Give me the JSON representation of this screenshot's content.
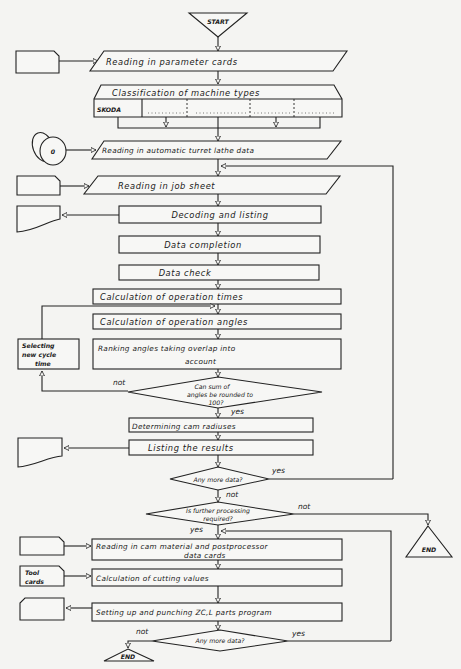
{
  "diagram": {
    "type": "flowchart",
    "terminals": {
      "start": "START",
      "end_1": "END",
      "end_2": "END"
    },
    "steps": {
      "s1": "Reading in parameter cards",
      "s2": "Classification of machine types",
      "s2_first_cell": "SKODA",
      "s3": "Reading in automatic turret lathe data",
      "s4": "Reading in job sheet",
      "s5": "Decoding and listing",
      "s6": "Data completion",
      "s7": "Data check",
      "s8": "Calculation of operation times",
      "s9": "Calculation of operation angles",
      "s10_line1": "Ranking angles taking overlap into",
      "s10_line2": "account",
      "side_line1": "Selecting",
      "side_line2": "new cycle",
      "side_line3": "time",
      "s11": "Determining cam radiuses",
      "s12": "Listing the results",
      "s13_line1": "Reading in cam material and postprocessor",
      "s13_line2": "data cards",
      "s14": "Calculation of cutting values",
      "s15": "Setting up and punching ZC,L parts program"
    },
    "decisions": {
      "d1_line1": "Can sum of",
      "d1_line2": "angles be rounded to",
      "d1_line3": "100?",
      "d2": "Any more data?",
      "d3_line1": "Is further processing",
      "d3_line2": "required?",
      "d4": "Any more data?"
    },
    "branch_labels": {
      "d1_no": "not",
      "d1_yes": "yes",
      "d2_yes": "yes",
      "d2_no": "not",
      "d3_no": "not",
      "d3_yes": "yes",
      "d4_no": "not",
      "d4_yes": "yes"
    },
    "io_symbols": {
      "tape_label": "0",
      "tool_cards_line1": "Tool",
      "tool_cards_line2": "cards"
    }
  }
}
